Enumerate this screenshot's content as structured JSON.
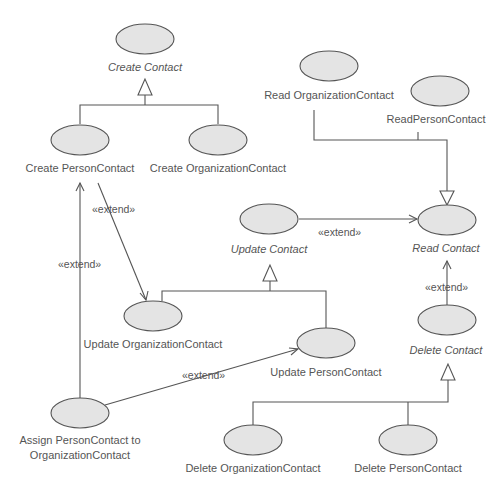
{
  "diagram": {
    "type": "UML use case diagram",
    "colors": {
      "use_case_fill": "#e4e4e4",
      "stroke": "#555555",
      "text": "#555555",
      "background": "#ffffff"
    },
    "use_cases": {
      "create_contact": {
        "label": "Create Contact",
        "abstract": true
      },
      "create_person_contact": {
        "label": "Create PersonContact",
        "abstract": false
      },
      "create_organization_contact": {
        "label": "Create OrganizationContact",
        "abstract": false
      },
      "read_organization_contact": {
        "label": "Read OrganizationContact",
        "abstract": false
      },
      "read_person_contact": {
        "label": "ReadPersonContact",
        "abstract": false
      },
      "update_contact": {
        "label": "Update Contact",
        "abstract": true
      },
      "read_contact": {
        "label": "Read Contact",
        "abstract": true
      },
      "update_organization_contact": {
        "label": "Update OrganizationContact",
        "abstract": false
      },
      "update_person_contact": {
        "label": "Update PersonContact",
        "abstract": false
      },
      "delete_contact": {
        "label": "Delete Contact",
        "abstract": true
      },
      "assign_person_to_org": {
        "label_line1": "Assign PersonContact to",
        "label_line2": "OrganizationContact",
        "abstract": false
      },
      "delete_organization_contact": {
        "label": "Delete OrganizationContact",
        "abstract": false
      },
      "delete_person_contact": {
        "label": "Delete PersonContact",
        "abstract": false
      }
    },
    "relationships": {
      "generalizations": [
        {
          "parent": "Create Contact",
          "children": [
            "Create PersonContact",
            "Create OrganizationContact"
          ]
        },
        {
          "parent": "Read Contact",
          "children": [
            "Read OrganizationContact",
            "ReadPersonContact"
          ]
        },
        {
          "parent": "Update Contact",
          "children": [
            "Update OrganizationContact",
            "Update PersonContact"
          ]
        },
        {
          "parent": "Delete Contact",
          "children": [
            "Delete OrganizationContact",
            "Delete PersonContact"
          ]
        }
      ],
      "extends": [
        {
          "from": "Create PersonContact",
          "to": "Update OrganizationContact",
          "label": "«extend»"
        },
        {
          "from": "Assign PersonContact to OrganizationContact",
          "to": "Create PersonContact",
          "label": "«extend»"
        },
        {
          "from": "Update Contact",
          "to": "Read Contact",
          "label": "«extend»"
        },
        {
          "from": "Delete Contact",
          "to": "Read Contact",
          "label": "«extend»"
        },
        {
          "from": "Assign PersonContact to OrganizationContact",
          "to": "Update PersonContact",
          "label": "«extend»"
        }
      ]
    }
  }
}
